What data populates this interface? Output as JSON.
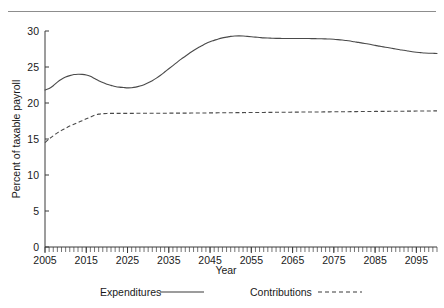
{
  "page": {
    "divider_present": true,
    "background_color": "#ffffff",
    "ink_color": "#1a1a1a"
  },
  "chart_data": {
    "type": "line",
    "title": "",
    "xlabel": "Year",
    "ylabel": "Percent of taxable payroll",
    "xlim": [
      2005,
      2100
    ],
    "ylim": [
      0,
      30
    ],
    "yticks": [
      0,
      5,
      10,
      15,
      20,
      25,
      30
    ],
    "ytick_labels": [
      "0",
      "5",
      "10",
      "15",
      "20",
      "25",
      "30"
    ],
    "xticks": [
      2005,
      2015,
      2025,
      2035,
      2045,
      2055,
      2065,
      2075,
      2085,
      2095
    ],
    "xtick_labels": [
      "2005",
      "2015",
      "2025",
      "2035",
      "2045",
      "2055",
      "2065",
      "2075",
      "2085",
      "2095"
    ],
    "minor_xtick_interval": 1,
    "grid": false,
    "legend_position": "below",
    "x": [
      2005,
      2006,
      2007,
      2008,
      2009,
      2010,
      2011,
      2012,
      2013,
      2014,
      2015,
      2016,
      2017,
      2018,
      2019,
      2020,
      2021,
      2022,
      2023,
      2024,
      2025,
      2026,
      2027,
      2028,
      2029,
      2030,
      2031,
      2032,
      2033,
      2034,
      2035,
      2036,
      2037,
      2038,
      2039,
      2040,
      2041,
      2042,
      2043,
      2044,
      2045,
      2046,
      2047,
      2048,
      2049,
      2050,
      2051,
      2052,
      2053,
      2054,
      2055,
      2056,
      2057,
      2058,
      2059,
      2060,
      2061,
      2062,
      2063,
      2064,
      2065,
      2066,
      2067,
      2068,
      2069,
      2070,
      2071,
      2072,
      2073,
      2074,
      2075,
      2076,
      2077,
      2078,
      2079,
      2080,
      2081,
      2082,
      2083,
      2084,
      2085,
      2086,
      2087,
      2088,
      2089,
      2090,
      2091,
      2092,
      2093,
      2094,
      2095,
      2096,
      2097,
      2098,
      2099,
      2100
    ],
    "series": [
      {
        "name": "Expenditures",
        "style": "solid",
        "color": "#4a4a4a",
        "values": [
          21.8,
          22.0,
          22.4,
          22.9,
          23.3,
          23.6,
          23.8,
          23.95,
          24.0,
          23.98,
          23.9,
          23.7,
          23.4,
          23.1,
          22.85,
          22.6,
          22.45,
          22.3,
          22.2,
          22.15,
          22.1,
          22.12,
          22.2,
          22.35,
          22.55,
          22.8,
          23.1,
          23.45,
          23.85,
          24.3,
          24.75,
          25.2,
          25.65,
          26.1,
          26.5,
          26.9,
          27.3,
          27.65,
          27.95,
          28.25,
          28.5,
          28.7,
          28.9,
          29.05,
          29.15,
          29.25,
          29.3,
          29.32,
          29.3,
          29.25,
          29.2,
          29.15,
          29.1,
          29.05,
          29.02,
          29.0,
          28.98,
          28.97,
          28.96,
          28.96,
          28.95,
          28.95,
          28.95,
          28.95,
          28.95,
          28.94,
          28.93,
          28.92,
          28.9,
          28.88,
          28.85,
          28.8,
          28.74,
          28.68,
          28.6,
          28.5,
          28.42,
          28.32,
          28.22,
          28.12,
          28.0,
          27.9,
          27.8,
          27.7,
          27.6,
          27.5,
          27.4,
          27.32,
          27.22,
          27.12,
          27.05,
          27.0,
          26.95,
          26.92,
          26.9,
          26.88
        ]
      },
      {
        "name": "Contributions",
        "style": "dashed",
        "color": "#4a4a4a",
        "values": [
          14.5,
          15.0,
          15.45,
          15.85,
          16.2,
          16.5,
          16.8,
          17.05,
          17.3,
          17.55,
          17.8,
          18.05,
          18.3,
          18.45,
          18.52,
          18.55,
          18.56,
          18.56,
          18.56,
          18.56,
          18.56,
          18.56,
          18.57,
          18.57,
          18.57,
          18.57,
          18.58,
          18.58,
          18.58,
          18.58,
          18.59,
          18.59,
          18.59,
          18.6,
          18.6,
          18.6,
          18.61,
          18.61,
          18.62,
          18.62,
          18.63,
          18.63,
          18.64,
          18.64,
          18.65,
          18.65,
          18.66,
          18.66,
          18.67,
          18.67,
          18.68,
          18.68,
          18.69,
          18.69,
          18.7,
          18.7,
          18.71,
          18.71,
          18.72,
          18.72,
          18.73,
          18.73,
          18.74,
          18.74,
          18.75,
          18.75,
          18.76,
          18.76,
          18.77,
          18.77,
          18.78,
          18.78,
          18.79,
          18.79,
          18.8,
          18.8,
          18.81,
          18.81,
          18.82,
          18.82,
          18.83,
          18.83,
          18.84,
          18.84,
          18.85,
          18.85,
          18.86,
          18.86,
          18.87,
          18.87,
          18.88,
          18.88,
          18.89,
          18.89,
          18.9,
          18.9
        ]
      }
    ],
    "legend": [
      {
        "label": "Expenditures",
        "style": "solid"
      },
      {
        "label": "Contributions",
        "style": "dashed"
      }
    ]
  }
}
